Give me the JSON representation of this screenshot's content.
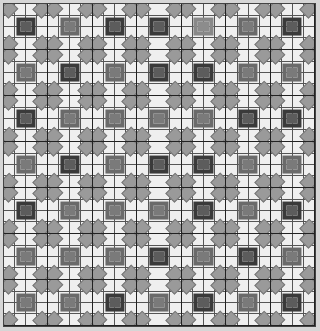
{
  "pattern": {
    "type": "quilt-block-grid",
    "columns": 7,
    "rows": 7,
    "colors": {
      "background": "#d6d6d6",
      "cell": "#efefef",
      "diamond": "#9a9a9a",
      "grid_line": "#555555",
      "block_border": "#222222",
      "frame_dark": "#3a3a3a",
      "frame_medium": "#6a6a6a",
      "core_dark": "#5c5c5c",
      "core_medium": "#7a7a7a",
      "core_light": "#8c8c8c"
    },
    "blocks": [
      [
        "dark",
        "medium",
        "dark",
        "dark",
        "light",
        "medium",
        "dark"
      ],
      [
        "medium",
        "dark",
        "medium",
        "dark",
        "dark",
        "medium",
        "medium"
      ],
      [
        "dark",
        "medium",
        "medium",
        "medium",
        "medium",
        "dark",
        "dark"
      ],
      [
        "medium",
        "dark",
        "medium",
        "dark",
        "dark",
        "medium",
        "medium"
      ],
      [
        "dark",
        "medium",
        "medium",
        "medium",
        "dark",
        "medium",
        "dark"
      ],
      [
        "medium",
        "medium",
        "medium",
        "dark",
        "medium",
        "dark",
        "medium"
      ],
      [
        "medium",
        "medium",
        "dark",
        "medium",
        "dark",
        "medium",
        "dark"
      ]
    ]
  }
}
